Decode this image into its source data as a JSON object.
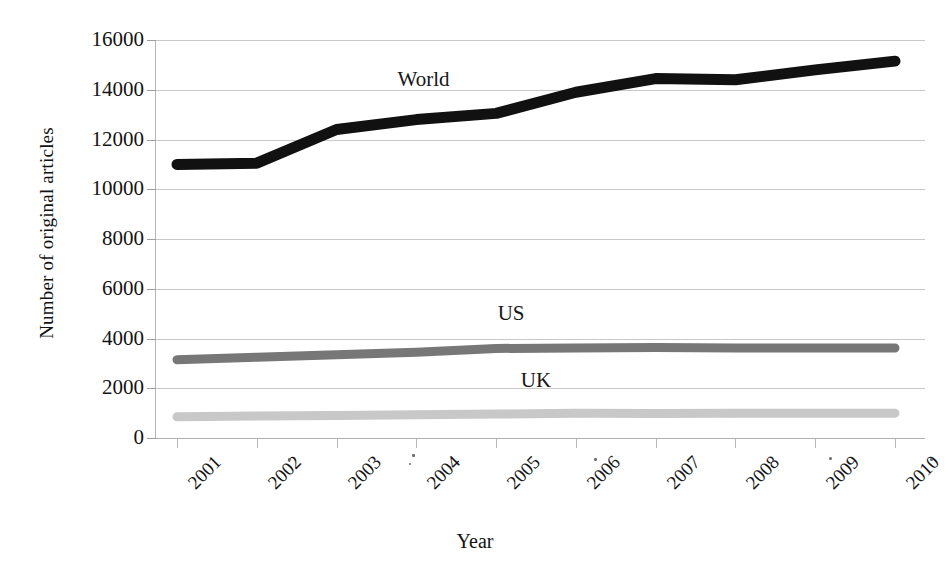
{
  "chart_data": {
    "type": "line",
    "title": "",
    "xlabel": "Year",
    "ylabel": "Number of original articles",
    "categories": [
      "2001",
      "2002",
      "2003",
      "2004",
      "2005",
      "2006",
      "2007",
      "2008",
      "2009",
      "2010"
    ],
    "x": [
      2001,
      2002,
      2003,
      2004,
      2005,
      2006,
      2007,
      2008,
      2009,
      2010
    ],
    "series": [
      {
        "name": "World",
        "color": "#111111",
        "values": [
          11000,
          11050,
          12400,
          12800,
          13050,
          13900,
          14450,
          14400,
          14800,
          15150
        ]
      },
      {
        "name": "US",
        "color": "#777777",
        "values": [
          3150,
          3250,
          3350,
          3450,
          3600,
          3620,
          3640,
          3620,
          3620,
          3620
        ]
      },
      {
        "name": "UK",
        "color": "#c8c8c8",
        "values": [
          850,
          880,
          900,
          930,
          960,
          1000,
          980,
          990,
          1000,
          1000
        ]
      }
    ],
    "ylim": [
      0,
      16000
    ],
    "ytick_values": [
      0,
      2000,
      4000,
      6000,
      8000,
      10000,
      12000,
      14000,
      16000
    ],
    "ytick_labels": [
      "0",
      "2000",
      "4000",
      "6000",
      "8000",
      "10000",
      "12000",
      "14000",
      "16000"
    ],
    "grid": true,
    "grid_axis": "y",
    "legend_position": "inline-annotations",
    "annotations": [
      {
        "text": "World",
        "series": "World",
        "x_frac": 0.315,
        "y_frac": 0.073
      },
      {
        "text": "US",
        "series": "US",
        "x_frac": 0.445,
        "y_frac": 0.66
      },
      {
        "text": "UK",
        "series": "UK",
        "x_frac": 0.475,
        "y_frac": 0.828
      }
    ]
  }
}
